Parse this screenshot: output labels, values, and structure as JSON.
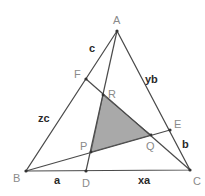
{
  "diagram": {
    "colors": {
      "outer_fill": "#ececec",
      "inner_fill": "#a9a9a9",
      "line": "#4a4a4a",
      "point_label": "#8a8a8a",
      "segment_label": "#2a2a2a"
    },
    "vertices": [
      "A",
      "B",
      "C"
    ],
    "side_points": {
      "D": "on BC",
      "E": "on CA",
      "F": "on AB"
    },
    "cevians": [
      {
        "from": "A",
        "to": "D"
      },
      {
        "from": "B",
        "to": "E"
      },
      {
        "from": "C",
        "to": "F"
      }
    ],
    "inner_triangle": [
      "P",
      "Q",
      "R"
    ],
    "point_labels": {
      "A": "A",
      "B": "B",
      "C": "C",
      "D": "D",
      "E": "E",
      "F": "F",
      "P": "P",
      "Q": "Q",
      "R": "R"
    },
    "segment_labels": {
      "BD": "a",
      "DC": "xa",
      "CE": "b",
      "EA": "yb",
      "AF": "c",
      "FB": "zc"
    }
  }
}
